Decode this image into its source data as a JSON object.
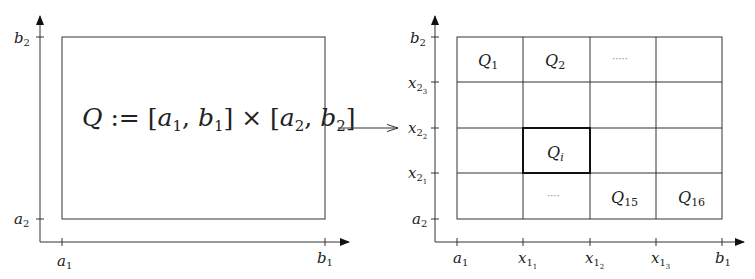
{
  "left_panel": {
    "formula": {
      "Q": "Q",
      "assign": " := ",
      "open1": "[",
      "a": "a",
      "one": "1",
      "comma": ", ",
      "b": "b",
      "close1": "]",
      "times": " × ",
      "open2": "[",
      "two": "2",
      "close2": "]"
    },
    "y_ticks": [
      {
        "base": "b",
        "sub": "2"
      },
      {
        "base": "a",
        "sub": "2"
      }
    ],
    "x_ticks": [
      {
        "base": "a",
        "sub": "1"
      },
      {
        "base": "b",
        "sub": "1"
      }
    ]
  },
  "transform_arrow": "maps-to",
  "right_panel": {
    "grid": {
      "rows": 4,
      "cols": 4,
      "highlighted_cell": {
        "row": 2,
        "col": 1
      }
    },
    "cells": {
      "q1": {
        "base": "Q",
        "sub": "1"
      },
      "q2": {
        "base": "Q",
        "sub": "2"
      },
      "dots_top": "·····",
      "qi": {
        "base": "Q",
        "sub": "i"
      },
      "dots_bottom": "····",
      "q15": {
        "base": "Q",
        "sub": "15"
      },
      "q16": {
        "base": "Q",
        "sub": "16"
      }
    },
    "y_ticks": [
      {
        "base": "b",
        "sub": "2",
        "subsub": ""
      },
      {
        "base": "x",
        "sub": "2",
        "subsub": "3"
      },
      {
        "base": "x",
        "sub": "2",
        "subsub": "2"
      },
      {
        "base": "x",
        "sub": "2",
        "subsub": "1"
      },
      {
        "base": "a",
        "sub": "2",
        "subsub": ""
      }
    ],
    "x_ticks": [
      {
        "base": "a",
        "sub": "1",
        "subsub": ""
      },
      {
        "base": "x",
        "sub": "1",
        "subsub": "1"
      },
      {
        "base": "x",
        "sub": "1",
        "subsub": "2"
      },
      {
        "base": "x",
        "sub": "1",
        "subsub": "3"
      },
      {
        "base": "b",
        "sub": "1",
        "subsub": ""
      }
    ]
  }
}
